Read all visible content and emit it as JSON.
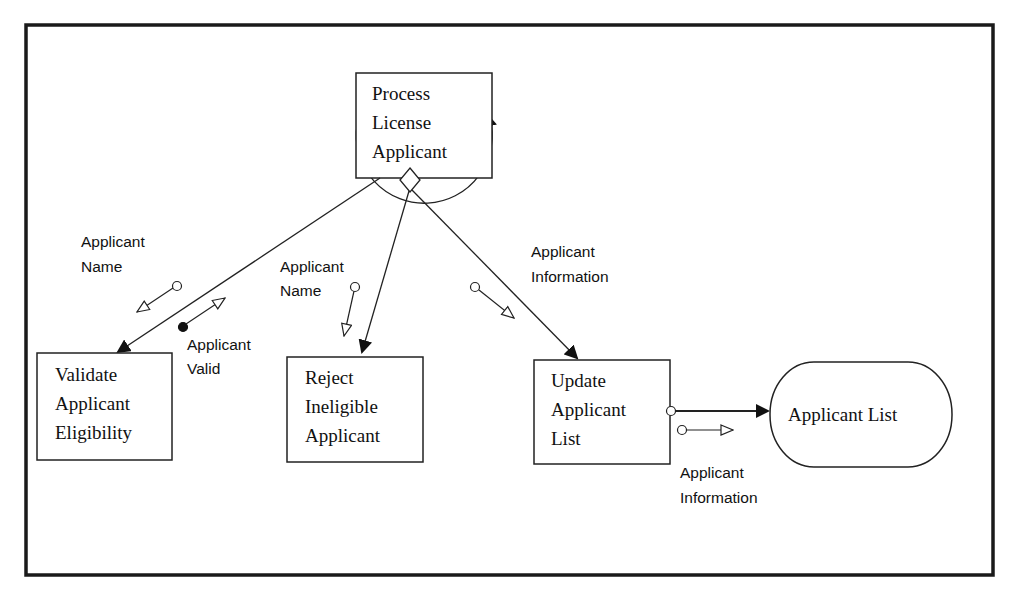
{
  "diagram": {
    "type": "structure-chart",
    "modules": {
      "process": {
        "lines": [
          "Process",
          "License",
          "Applicant"
        ]
      },
      "validate": {
        "lines": [
          "Validate",
          "Applicant",
          "Eligibility"
        ]
      },
      "reject": {
        "lines": [
          "Reject",
          "Ineligible",
          "Applicant"
        ]
      },
      "update": {
        "lines": [
          "Update",
          "Applicant",
          "List"
        ]
      }
    },
    "datastore": {
      "label": "Applicant List"
    },
    "couples": {
      "validate_in": {
        "lines": [
          "Applicant",
          "Name"
        ],
        "kind": "data"
      },
      "validate_out": {
        "lines": [
          "Applicant",
          "Valid"
        ],
        "kind": "control"
      },
      "reject_in": {
        "lines": [
          "Applicant",
          "Name"
        ],
        "kind": "data"
      },
      "update_in": {
        "lines": [
          "Applicant",
          "Information"
        ],
        "kind": "data"
      },
      "store_out": {
        "lines": [
          "Applicant",
          "Information"
        ],
        "kind": "data"
      }
    },
    "symbols": {
      "loop": "loop-arc-icon",
      "decision": "decision-diamond-icon",
      "data_couple": "open-circle-arrow-icon",
      "control_couple": "filled-circle-arrow-icon"
    }
  }
}
